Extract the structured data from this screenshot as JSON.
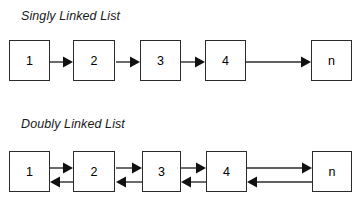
{
  "diagram": {
    "background_color": "#ffffff",
    "line_color": "#2b2b2b",
    "text_color": "#000000",
    "sections": [
      {
        "id": "singly",
        "title": "Singly Linked List",
        "link_type": "forward-only",
        "nodes": [
          {
            "label": "1"
          },
          {
            "label": "2"
          },
          {
            "label": "3"
          },
          {
            "label": "4"
          },
          {
            "label": "n"
          }
        ]
      },
      {
        "id": "doubly",
        "title": "Doubly Linked List",
        "link_type": "bidirectional",
        "nodes": [
          {
            "label": "1"
          },
          {
            "label": "2"
          },
          {
            "label": "3"
          },
          {
            "label": "4"
          },
          {
            "label": "n"
          }
        ]
      }
    ]
  }
}
